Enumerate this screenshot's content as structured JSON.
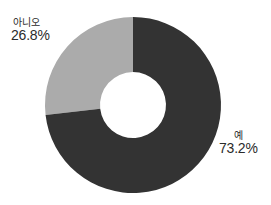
{
  "chart_data": {
    "type": "pie",
    "variant": "donut",
    "title": "",
    "xlabel": "",
    "ylabel": "",
    "legend_position": "none",
    "grid": false,
    "labels_inline": true,
    "start_angle_deg": 0,
    "direction": "clockwise",
    "inner_radius_ratio": 0.375,
    "categories": [
      "예",
      "아니오"
    ],
    "values": [
      73.2,
      26.8
    ],
    "value_unit": "%",
    "slices": [
      {
        "label": "예",
        "value": 73.2,
        "value_text": "73.2%",
        "color": "#333333",
        "start_deg": 0,
        "end_deg": 263.52
      },
      {
        "label": "아니오",
        "value": 26.8,
        "value_text": "26.8%",
        "color": "#ababab",
        "start_deg": 263.52,
        "end_deg": 360
      }
    ]
  },
  "colors": {
    "background": "#ffffff",
    "slice_yes": "#333333",
    "slice_no": "#ababab",
    "hole": "#ffffff",
    "text": "#2b2b2b"
  },
  "annotations": {
    "no": {
      "category": "아니오",
      "percent": "26.8%"
    },
    "yes": {
      "category": "예",
      "percent": "73.2%"
    }
  }
}
